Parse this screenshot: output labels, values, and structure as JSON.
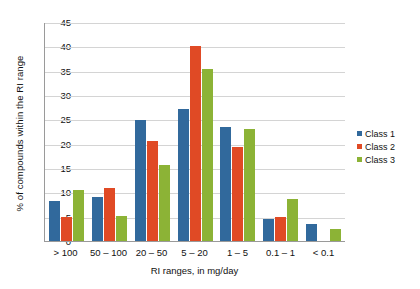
{
  "chart_data": {
    "type": "bar",
    "title": "",
    "xlabel": "RI ranges, in mg/day",
    "ylabel": "% of compounds within the RI range",
    "categories": [
      "> 100",
      "50 – 100",
      "20 – 50",
      "5 – 20",
      "1 – 5",
      "0.1 – 1",
      "< 0.1"
    ],
    "series": [
      {
        "name": "Class 1",
        "color": "#31699C",
        "values": [
          8.2,
          9.0,
          24.8,
          27.1,
          23.5,
          4.5,
          3.5
        ]
      },
      {
        "name": "Class 2",
        "color": "#E04A25",
        "values": [
          4.9,
          10.9,
          20.5,
          40.0,
          19.4,
          5.0,
          0
        ]
      },
      {
        "name": "Class 3",
        "color": "#8CB336",
        "values": [
          10.5,
          5.1,
          15.6,
          35.3,
          23.0,
          8.7,
          2.5
        ]
      }
    ],
    "ylim": [
      0,
      45
    ],
    "yticks": [
      0,
      5,
      10,
      15,
      20,
      25,
      30,
      35,
      40,
      45
    ],
    "ytick_labels": [
      "0",
      "5",
      "10",
      "15",
      "20",
      "25",
      "30",
      "35",
      "40",
      "45"
    ],
    "grid": true,
    "legend_position": "right"
  }
}
